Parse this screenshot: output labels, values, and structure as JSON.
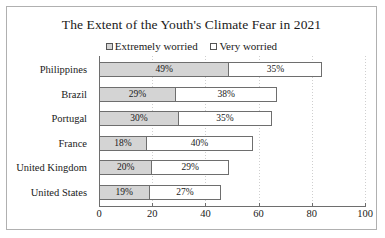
{
  "chart_data": {
    "type": "bar",
    "orientation": "horizontal",
    "stacked": true,
    "title": "The Extent of the Youth's Climate Fear in 2021",
    "xlabel": "",
    "ylabel": "",
    "xlim": [
      0,
      100
    ],
    "xticks": [
      "0",
      "20",
      "40",
      "60",
      "80",
      "100"
    ],
    "grid": true,
    "legend_position": "top",
    "categories": [
      "Philippines",
      "Brazil",
      "Portugal",
      "France",
      "United Kingdom",
      "United States"
    ],
    "series": [
      {
        "name": "Extremely worried",
        "color": "#d4d4d4",
        "values": [
          49,
          29,
          30,
          18,
          20,
          19
        ],
        "labels": [
          "49%",
          "29%",
          "30%",
          "18%",
          "20%",
          "19%"
        ]
      },
      {
        "name": "Very worried",
        "color": "#ffffff",
        "values": [
          35,
          38,
          35,
          40,
          29,
          27
        ],
        "labels": [
          "35%",
          "38%",
          "35%",
          "40%",
          "29%",
          "27%"
        ]
      }
    ]
  },
  "colors": {
    "series_a": "#d4d4d4",
    "series_b": "#ffffff",
    "outline": "#6e6e6e",
    "frame": "#b0b0b0",
    "gridline": "#cfcfcf",
    "text": "#1a1a1a"
  }
}
